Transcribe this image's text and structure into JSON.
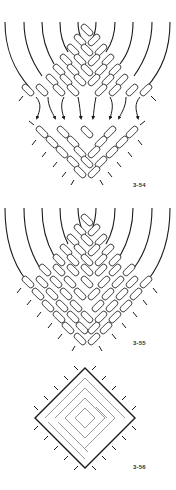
{
  "figures": [
    {
      "id": "fig-3-54",
      "label": "3-54",
      "description": "Strands cross over into a diamond knot grid, then arrows show strands redirected into a second knot section below"
    },
    {
      "id": "fig-3-55",
      "label": "3-55",
      "description": "Strands converge into a full diamond-shaped grid of diagonal knots"
    },
    {
      "id": "fig-3-56",
      "label": "3-56",
      "description": "Simplified diamond outline with nested square rings and short cord ends around the edge"
    }
  ],
  "colors": {
    "ink": "#1a1a1a",
    "background": "#ffffff",
    "label": "#333333"
  }
}
